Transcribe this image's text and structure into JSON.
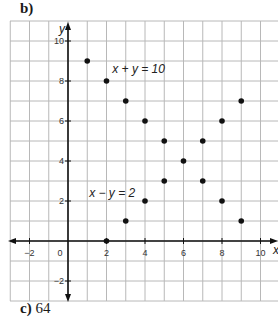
{
  "part_label": "b)",
  "footer": {
    "letter": "c)",
    "value": "64"
  },
  "chart_data": {
    "type": "scatter",
    "title": "",
    "xlabel": "x",
    "ylabel": "y",
    "xlim": [
      -3,
      11
    ],
    "ylim": [
      -3,
      11
    ],
    "grid": true,
    "x_ticks": [
      -2,
      0,
      2,
      4,
      6,
      8,
      10
    ],
    "y_ticks": [
      -2,
      2,
      4,
      6,
      8,
      10
    ],
    "series": [
      {
        "name": "x + y = 10",
        "points": [
          [
            1,
            9
          ],
          [
            2,
            8
          ],
          [
            3,
            7
          ],
          [
            4,
            6
          ],
          [
            5,
            5
          ],
          [
            6,
            4
          ],
          [
            7,
            3
          ],
          [
            8,
            2
          ],
          [
            9,
            1
          ]
        ]
      },
      {
        "name": "x - y = 2",
        "points": [
          [
            2,
            0
          ],
          [
            3,
            1
          ],
          [
            4,
            2
          ],
          [
            5,
            3
          ],
          [
            6,
            4
          ],
          [
            7,
            5
          ],
          [
            8,
            6
          ],
          [
            9,
            7
          ]
        ]
      }
    ],
    "annotations": [
      {
        "text": "x + y = 10",
        "x": 2.3,
        "y": 8.4
      },
      {
        "text": "x − y = 2",
        "x": 1.1,
        "y": 2.2
      }
    ]
  }
}
